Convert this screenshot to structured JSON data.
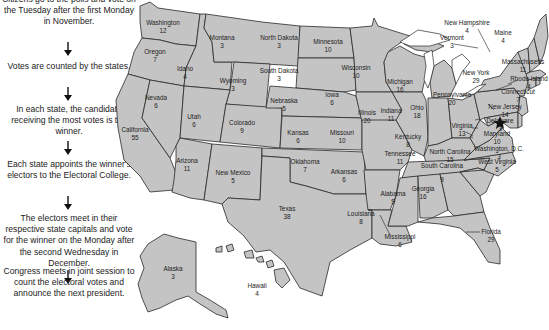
{
  "flow_steps": [
    "Citizens go to the polls and vote on the Tuesday after the first Monday in November.",
    "Votes are counted by the states.",
    "In each state, the candidate receiving the most votes is the winner.",
    "Each state appoints the winner's electors to the Electoral College.",
    "The electors meet in their respective state capitals and vote for the winner on the Monday after the second Wednesday in December.",
    "Congress meets in joint session to count the electoral votes and announce the next president."
  ],
  "colors": {
    "state_fill": "#c4c4c4",
    "border": "#2a2a2a",
    "text": "#1c1c1c",
    "background": "#ffffff"
  },
  "capital_marker_icon": "star-icon",
  "states": {
    "washington": {
      "name": "Washington",
      "votes": "12"
    },
    "oregon": {
      "name": "Oregon",
      "votes": "7"
    },
    "california": {
      "name": "California",
      "votes": "55"
    },
    "idaho": {
      "name": "Idaho",
      "votes": "4"
    },
    "nevada": {
      "name": "Nevada",
      "votes": "6"
    },
    "montana": {
      "name": "Montana",
      "votes": "3"
    },
    "wyoming": {
      "name": "Wyoming",
      "votes": "3"
    },
    "utah": {
      "name": "Utah",
      "votes": "6"
    },
    "arizona": {
      "name": "Arizona",
      "votes": "11"
    },
    "colorado": {
      "name": "Colorado",
      "votes": "9"
    },
    "new_mexico": {
      "name": "New Mexico",
      "votes": "5"
    },
    "north_dakota": {
      "name": "North Dakota",
      "votes": "3"
    },
    "south_dakota": {
      "name": "South Dakota",
      "votes": "3"
    },
    "nebraska": {
      "name": "Nebraska",
      "votes": "5"
    },
    "kansas": {
      "name": "Kansas",
      "votes": "6"
    },
    "oklahoma": {
      "name": "Oklahoma",
      "votes": "7"
    },
    "texas": {
      "name": "Texas",
      "votes": "38"
    },
    "minnesota": {
      "name": "Minnesota",
      "votes": "10"
    },
    "iowa": {
      "name": "Iowa",
      "votes": "6"
    },
    "missouri": {
      "name": "Missouri",
      "votes": "10"
    },
    "arkansas": {
      "name": "Arkansas",
      "votes": "6"
    },
    "louisiana": {
      "name": "Louisiana",
      "votes": "8"
    },
    "wisconsin": {
      "name": "Wisconsin",
      "votes": "10"
    },
    "illinois": {
      "name": "Illinois",
      "votes": "20"
    },
    "michigan": {
      "name": "Michigan",
      "votes": "16"
    },
    "indiana": {
      "name": "Indiana",
      "votes": "11"
    },
    "ohio": {
      "name": "Ohio",
      "votes": "18"
    },
    "kentucky": {
      "name": "Kentucky",
      "votes": "8"
    },
    "tennessee": {
      "name": "Tennessee",
      "votes": "11"
    },
    "mississippi": {
      "name": "Mississippi",
      "votes": "6"
    },
    "alabama": {
      "name": "Alabama",
      "votes": "9"
    },
    "georgia": {
      "name": "Georgia",
      "votes": "16"
    },
    "florida": {
      "name": "Florida",
      "votes": "29"
    },
    "south_carolina": {
      "name": "South Carolina",
      "votes": "9"
    },
    "north_carolina": {
      "name": "North Carolina",
      "votes": "15"
    },
    "virginia": {
      "name": "Virginia",
      "votes": "13"
    },
    "west_virginia": {
      "name": "West Virginia",
      "votes": "5"
    },
    "pennsylvania": {
      "name": "Pennsylvania",
      "votes": "20"
    },
    "new_york": {
      "name": "New York",
      "votes": "29"
    },
    "vermont": {
      "name": "Vermont",
      "votes": "3"
    },
    "new_hampshire": {
      "name": "New Hampshire",
      "votes": "4"
    },
    "maine": {
      "name": "Maine",
      "votes": "4"
    },
    "massachusetts": {
      "name": "Massachusetts",
      "votes": "11"
    },
    "rhode_island": {
      "name": "Rhode Island",
      "votes": "4"
    },
    "connecticut": {
      "name": "Connecticut",
      "votes": "7"
    },
    "new_jersey": {
      "name": "New Jersey",
      "votes": "14"
    },
    "delaware": {
      "name": "Delaware",
      "votes": "3"
    },
    "maryland": {
      "name": "Maryland",
      "votes": "10"
    },
    "dc": {
      "name": "Washington, D.C.",
      "votes": "3"
    },
    "alaska": {
      "name": "Alaska",
      "votes": "3"
    },
    "hawaii": {
      "name": "Hawaii",
      "votes": "4"
    }
  }
}
